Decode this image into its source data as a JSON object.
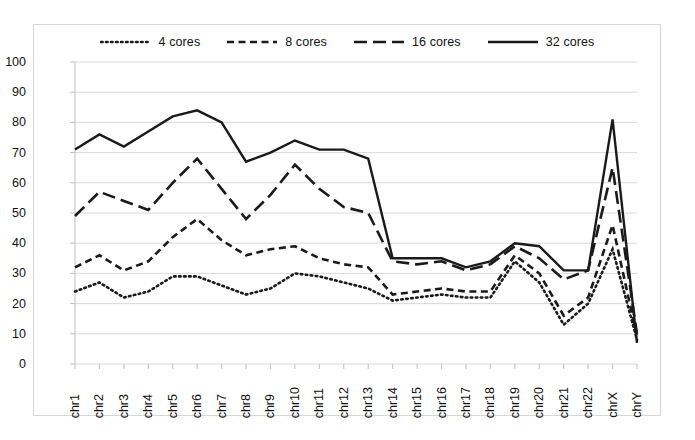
{
  "chart_data": {
    "type": "line",
    "title": "",
    "xlabel": "",
    "ylabel": "",
    "ylim": [
      0,
      100
    ],
    "ytick_step": 10,
    "grid": true,
    "legend_position": "top",
    "categories": [
      "chr1",
      "chr2",
      "chr3",
      "chr4",
      "chr5",
      "chr6",
      "chr7",
      "chr8",
      "chr9",
      "chr10",
      "chr11",
      "chr12",
      "chr13",
      "chr14",
      "chr15",
      "chr16",
      "chr17",
      "chr18",
      "chr19",
      "chr20",
      "chr21",
      "chr22",
      "chrX",
      "chrY"
    ],
    "yticks": [
      "0",
      "10",
      "20",
      "30",
      "40",
      "50",
      "60",
      "70",
      "80",
      "90",
      "100"
    ],
    "series": [
      {
        "name": "4 cores",
        "style": "dotted",
        "color": "#1a1a1a",
        "values": [
          24,
          27,
          22,
          24,
          29,
          29,
          26,
          23,
          25,
          30,
          29,
          27,
          25,
          21,
          22,
          23,
          22,
          22,
          34,
          27,
          13,
          20,
          38,
          8
        ]
      },
      {
        "name": "8 cores",
        "style": "dashed-short",
        "color": "#1a1a1a",
        "values": [
          32,
          36,
          31,
          34,
          42,
          48,
          41,
          36,
          38,
          39,
          35,
          33,
          32,
          23,
          24,
          25,
          24,
          24,
          36,
          30,
          16,
          22,
          46,
          9
        ]
      },
      {
        "name": "16 cores",
        "style": "dashed-long",
        "color": "#1a1a1a",
        "values": [
          49,
          57,
          54,
          51,
          60,
          68,
          58,
          48,
          56,
          66,
          58,
          52,
          50,
          34,
          33,
          34,
          31,
          33,
          39,
          35,
          28,
          31,
          65,
          10
        ]
      },
      {
        "name": "32 cores",
        "style": "solid",
        "color": "#1a1a1a",
        "values": [
          71,
          76,
          72,
          77,
          82,
          84,
          80,
          67,
          70,
          74,
          71,
          71,
          68,
          35,
          35,
          35,
          32,
          34,
          40,
          39,
          31,
          31,
          81,
          7
        ]
      }
    ]
  },
  "legend": {
    "items": [
      {
        "label": "4 cores"
      },
      {
        "label": "8 cores"
      },
      {
        "label": "16 cores"
      },
      {
        "label": "32 cores"
      }
    ]
  },
  "colors": {
    "line": "#1a1a1a",
    "grid": "#d9d9d9",
    "border": "#d7d7d7",
    "axis": "#bfbfbf",
    "background": "#ffffff"
  }
}
